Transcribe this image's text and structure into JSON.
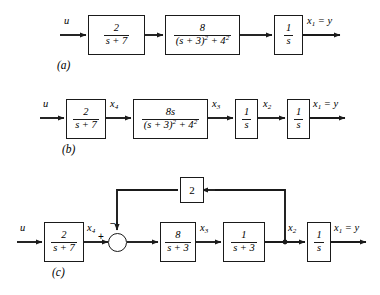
{
  "figure": {
    "background_color": "#ffffff",
    "line_color": "#1a1a1a"
  },
  "diagrams": [
    {
      "caption": "(a)",
      "input_label": "u",
      "output_label": "x₁ = y",
      "blocks": [
        {
          "name": "block-2-over-s-plus-7",
          "numerator": "2",
          "denominator": "s + 7"
        },
        {
          "name": "block-8-over-s-plus-3-sq-plus-4-sq",
          "numerator": "8",
          "denominator": "(s + 3)² + 4²"
        },
        {
          "name": "block-1-over-s",
          "numerator": "1",
          "denominator": "s"
        }
      ],
      "signals": []
    },
    {
      "caption": "(b)",
      "input_label": "u",
      "output_label": "x₁ = y",
      "blocks": [
        {
          "name": "block-2-over-s-plus-7",
          "numerator": "2",
          "denominator": "s + 7"
        },
        {
          "name": "block-8s-over-s-plus-3-sq-plus-4-sq",
          "numerator": "8s",
          "denominator": "(s + 3)² + 4²"
        },
        {
          "name": "block-1-over-s-first",
          "numerator": "1",
          "denominator": "s"
        },
        {
          "name": "block-1-over-s-second",
          "numerator": "1",
          "denominator": "s"
        }
      ],
      "signals": [
        "x₄",
        "x₃",
        "x₂"
      ]
    },
    {
      "caption": "(c)",
      "input_label": "u",
      "output_label": "x₁ = y",
      "blocks": [
        {
          "name": "block-2-over-s-plus-7",
          "numerator": "2",
          "denominator": "s + 7"
        },
        {
          "name": "block-8-over-s-plus-3",
          "numerator": "8",
          "denominator": "s + 3"
        },
        {
          "name": "block-1-over-s-plus-3",
          "numerator": "1",
          "denominator": "s + 3"
        },
        {
          "name": "block-1-over-s",
          "numerator": "1",
          "denominator": "s"
        }
      ],
      "feedback_gain": "2",
      "summing_junction": {
        "name": "summing-junction",
        "positive_sign": "+",
        "negative_sign": "−"
      },
      "signals": [
        "x₄",
        "x₃",
        "x₂"
      ]
    }
  ],
  "labels": {
    "u": "u",
    "x1_eq_y": "x",
    "x1_sub": "1",
    "x1_tail": " = y",
    "x2": "x",
    "x2_sub": "2",
    "x3": "x",
    "x3_sub": "3",
    "x4": "x",
    "x4_sub": "4",
    "gain2": "2",
    "num_2": "2",
    "den_s7": "s + 7",
    "num_8": "8",
    "num_8s": "8s",
    "den_quad": "(s + 3)",
    "den_quad_tail": " + 4",
    "num_1": "1",
    "den_s": "s",
    "den_s3": "s + 3",
    "caption_a": "(a)",
    "caption_b": "(b)",
    "caption_c": "(c)",
    "sign_plus": "+",
    "sign_minus": "−",
    "exp_2": "2"
  }
}
